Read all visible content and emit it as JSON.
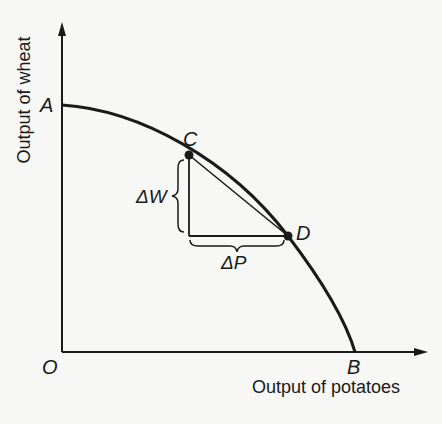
{
  "diagram": {
    "axes": {
      "x_label": "Output of potatoes",
      "y_label": "Output of wheat",
      "origin_label": "O"
    },
    "points": {
      "A": "A",
      "B": "B",
      "C": "C",
      "D": "D"
    },
    "annotations": {
      "delta_w": "ΔW",
      "delta_p": "ΔP"
    },
    "colors": {
      "ink": "#1a1a1a",
      "paper": "#f7f7f5"
    }
  }
}
